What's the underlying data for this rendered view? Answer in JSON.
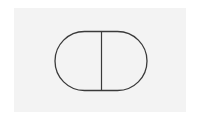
{
  "diagram": {
    "shape": "stadium",
    "divider": "vertical",
    "colors": {
      "background": "#ffffff",
      "panel": "#f3f3f3",
      "stroke": "#3a3a3a"
    }
  }
}
